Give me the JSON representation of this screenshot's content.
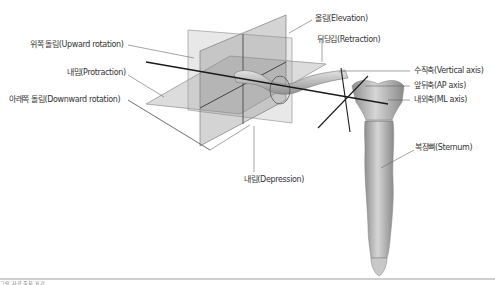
{
  "figure": {
    "labels": {
      "upward_rotation": "위쪽 돌림(Upward rotation)",
      "protraction": "내밈(Protraction)",
      "downward_rotation": "아래쪽 돌림(Downward rotation)",
      "elevation": "올림(Elevation)",
      "retraction": "뒤당김(Retraction)",
      "vertical_axis": "수직축(Vertical axis)",
      "ap_axis": "앞뒤축(AP axis)",
      "ml_axis": "내외축(ML axis)",
      "sternum": "복장뼈(Sternum)",
      "depression": "내림(Depression)"
    },
    "caption": "그림 자료 출처 표기",
    "colors": {
      "plane_fill": "#9a9a9a",
      "plane_edge": "#888888",
      "axis_line": "#1a1a1a",
      "leader_line": "#666666",
      "bone": "#b8b8b8",
      "rule": "#cfcfcf"
    }
  }
}
